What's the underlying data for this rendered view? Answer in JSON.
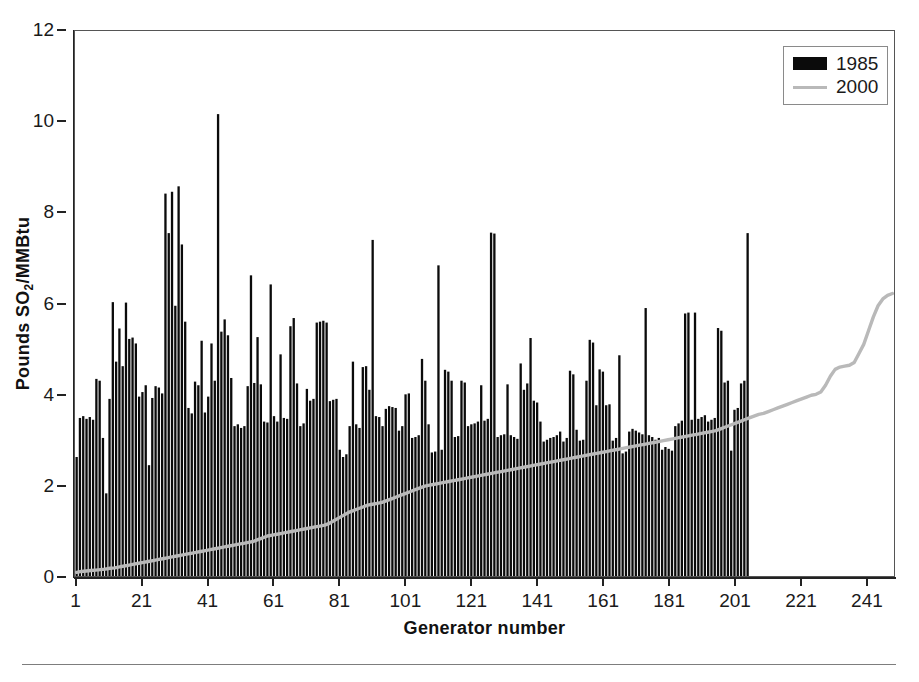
{
  "chart_data": {
    "type": "bar",
    "title": "",
    "subtitle": "",
    "xlabel": "Generator number",
    "ylabel": "Pounds SO2/MMBtu",
    "ylabel_parts": {
      "pre": "Pounds  SO",
      "sub": "2",
      "post": "/MMBtu"
    },
    "xlim": [
      1,
      249
    ],
    "ylim": [
      0,
      12
    ],
    "ytick_values": [
      0,
      2,
      4,
      6,
      8,
      10,
      12
    ],
    "ytick_labels": [
      "0",
      "2",
      "4",
      "6",
      "8",
      "10",
      "12"
    ],
    "xtick_values": [
      1,
      21,
      41,
      61,
      81,
      101,
      121,
      141,
      161,
      181,
      201,
      221,
      241
    ],
    "xtick_labels": [
      "1",
      "21",
      "41",
      "61",
      "81",
      "101",
      "121",
      "141",
      "161",
      "181",
      "201",
      "221",
      "241"
    ],
    "grid": false,
    "legend_position": "top-right",
    "colors": {
      "bar_1985": "#0b0b0b",
      "line_2000": "#b9b9b9",
      "axis": "#222222",
      "frame": "#555555"
    },
    "series": [
      {
        "name": "1985",
        "type": "bar",
        "color": "#0b0b0b",
        "values": [
          2.62,
          3.48,
          3.52,
          3.46,
          3.5,
          3.44,
          4.34,
          4.3,
          3.04,
          1.82,
          3.9,
          6.03,
          4.72,
          5.45,
          4.62,
          6.02,
          5.22,
          5.25,
          5.12,
          3.95,
          4.05,
          4.2,
          2.44,
          3.92,
          4.18,
          4.15,
          4.02,
          8.42,
          7.55,
          8.46,
          5.95,
          8.58,
          7.3,
          5.6,
          3.7,
          3.58,
          4.28,
          4.2,
          5.18,
          3.6,
          3.95,
          5.12,
          4.3,
          10.17,
          5.38,
          5.65,
          5.3,
          4.36,
          3.3,
          3.34,
          3.26,
          3.3,
          4.18,
          6.62,
          4.25,
          5.26,
          4.22,
          3.4,
          3.38,
          6.42,
          3.52,
          3.4,
          4.88,
          3.48,
          3.46,
          5.5,
          5.68,
          4.24,
          3.3,
          3.36,
          4.12,
          3.86,
          3.9,
          5.58,
          5.6,
          5.62,
          5.58,
          3.85,
          3.88,
          3.9,
          2.78,
          2.62,
          2.68,
          3.3,
          4.72,
          3.34,
          3.26,
          4.6,
          4.62,
          4.1,
          7.4,
          3.52,
          3.5,
          3.3,
          3.68,
          3.74,
          3.72,
          3.7,
          3.2,
          3.3,
          4.0,
          4.02,
          3.04,
          3.06,
          3.1,
          4.78,
          4.3,
          3.34,
          2.72,
          2.74,
          6.84,
          2.78,
          4.54,
          4.5,
          4.3,
          3.06,
          3.08,
          4.3,
          4.26,
          3.3,
          3.34,
          3.36,
          3.4,
          4.2,
          3.42,
          3.46,
          7.56,
          7.54,
          3.06,
          3.1,
          3.12,
          4.22,
          3.1,
          3.06,
          3.02,
          4.68,
          4.1,
          4.24,
          5.24,
          3.86,
          3.82,
          3.4,
          2.96,
          3.0,
          3.04,
          3.06,
          3.1,
          3.18,
          2.96,
          3.04,
          4.52,
          4.44,
          3.22,
          2.98,
          3.0,
          4.3,
          5.2,
          5.14,
          3.76,
          4.55,
          4.5,
          3.76,
          3.78,
          2.98,
          3.04,
          4.86,
          2.7,
          2.74,
          3.18,
          3.24,
          3.2,
          3.16,
          3.12,
          5.9,
          3.1,
          3.06,
          3.0,
          3.04,
          2.78,
          2.84,
          2.8,
          2.76,
          3.3,
          3.36,
          3.42,
          5.78,
          5.8,
          3.44,
          5.8,
          3.46,
          3.5,
          3.54,
          3.4,
          3.44,
          3.48,
          5.46,
          5.4,
          4.26,
          4.3,
          2.76,
          3.66,
          3.7,
          4.24,
          4.3,
          7.55
        ]
      },
      {
        "name": "2000",
        "type": "line",
        "color": "#b9b9b9",
        "values": [
          0.08,
          0.1,
          0.11,
          0.12,
          0.13,
          0.14,
          0.15,
          0.17,
          0.18,
          0.2,
          0.22,
          0.24,
          0.26,
          0.28,
          0.3,
          0.32,
          0.34,
          0.36,
          0.38,
          0.4,
          0.42,
          0.44,
          0.46,
          0.48,
          0.5,
          0.52,
          0.54,
          0.56,
          0.58,
          0.6,
          0.62,
          0.64,
          0.66,
          0.68,
          0.7,
          0.72,
          0.74,
          0.76,
          0.8,
          0.84,
          0.88,
          0.9,
          0.92,
          0.94,
          0.96,
          0.98,
          1.0,
          1.02,
          1.04,
          1.06,
          1.08,
          1.1,
          1.12,
          1.16,
          1.22,
          1.28,
          1.34,
          1.4,
          1.44,
          1.48,
          1.52,
          1.56,
          1.58,
          1.6,
          1.62,
          1.66,
          1.7,
          1.74,
          1.78,
          1.82,
          1.86,
          1.9,
          1.94,
          1.98,
          2.0,
          2.02,
          2.04,
          2.06,
          2.08,
          2.1,
          2.12,
          2.14,
          2.16,
          2.18,
          2.2,
          2.22,
          2.24,
          2.26,
          2.28,
          2.3,
          2.32,
          2.34,
          2.36,
          2.38,
          2.4,
          2.42,
          2.44,
          2.46,
          2.48,
          2.5,
          2.52,
          2.54,
          2.56,
          2.58,
          2.6,
          2.62,
          2.64,
          2.66,
          2.68,
          2.7,
          2.72,
          2.74,
          2.76,
          2.78,
          2.8,
          2.82,
          2.84,
          2.86,
          2.88,
          2.9,
          2.92,
          2.94,
          2.96,
          2.98,
          3.0,
          3.02,
          3.04,
          3.06,
          3.08,
          3.1,
          3.12,
          3.14,
          3.16,
          3.18,
          3.2,
          3.24,
          3.28,
          3.32,
          3.36,
          3.4,
          3.44,
          3.48,
          3.52,
          3.56,
          3.58,
          3.62,
          3.66,
          3.7,
          3.74,
          3.78,
          3.82,
          3.86,
          3.9,
          3.94,
          3.98,
          4.0,
          4.05,
          4.2,
          4.4,
          4.55,
          4.6,
          4.62,
          4.64,
          4.7,
          4.9,
          5.1,
          5.4,
          5.7,
          5.95,
          6.1,
          6.18,
          6.22
        ],
        "x_start": 88
      }
    ]
  },
  "legend": {
    "entries": [
      {
        "label": "1985",
        "marker": "bar"
      },
      {
        "label": "2000",
        "marker": "line"
      }
    ]
  }
}
